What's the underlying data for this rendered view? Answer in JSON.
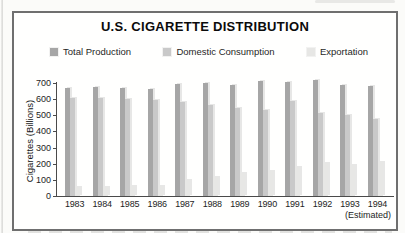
{
  "page": {
    "title": "U.S. CIGARETTE DISTRIBUTION",
    "estimated_note": "(Estimated)"
  },
  "colors": {
    "total_production": "#a6a6a6",
    "domestic_consumption": "#c9c9c9",
    "exportation": "#e7e7e5",
    "axis": "#4a4a4a",
    "box_border": "#6f6f6f"
  },
  "chart_data": {
    "type": "bar",
    "title": "U.S. CIGARETTE DISTRIBUTION",
    "xlabel": "",
    "ylabel": "Cigarettes (Billions)",
    "ylim": [
      0,
      700
    ],
    "yticks": [
      0,
      100,
      200,
      300,
      400,
      500,
      600,
      700
    ],
    "grid": false,
    "legend_position": "top",
    "categories": [
      "1983",
      "1984",
      "1985",
      "1986",
      "1987",
      "1988",
      "1989",
      "1990",
      "1991",
      "1992",
      "1993",
      "1994"
    ],
    "x_note_under_last_category": "(Estimated)",
    "series": [
      {
        "name": "Total Production",
        "color": "#a6a6a6",
        "values": [
          670,
          675,
          670,
          665,
          695,
          700,
          690,
          715,
          705,
          720,
          685,
          680
        ]
      },
      {
        "name": "Domestic Consumption",
        "color": "#c9c9c9",
        "values": [
          608,
          610,
          604,
          592,
          580,
          565,
          545,
          535,
          590,
          512,
          500,
          480
        ]
      },
      {
        "name": "Exportation",
        "color": "#e7e7e5",
        "values": [
          55,
          55,
          60,
          65,
          100,
          115,
          143,
          156,
          180,
          205,
          195,
          210
        ]
      }
    ]
  }
}
